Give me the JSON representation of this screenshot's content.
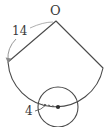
{
  "figure": {
    "type": "geometry-diagram",
    "stroke_color": "#4a4a4a",
    "label_color": "#3a3a3a",
    "background_color": "#ffffff",
    "labels": {
      "apex": "O",
      "slant_radius": "14",
      "base_radius": "4"
    },
    "sector": {
      "name": "cone-lateral-sector",
      "apex": {
        "x": 56,
        "y": 21
      },
      "radius_px": 48,
      "left_vertex": {
        "x": 8,
        "y": 62
      },
      "right_vertex": {
        "x": 103,
        "y": 68
      },
      "arc_lowest_point": {
        "x": 57,
        "y": 88
      },
      "slant_length_value": "14"
    },
    "circle": {
      "name": "cone-base-circle",
      "center": {
        "x": 58,
        "y": 107
      },
      "radius_px": 20,
      "radius_value": "4",
      "center_dot": true,
      "radius_line_style": "dashed",
      "radius_line_direction": "left"
    },
    "leaders": {
      "slant_leader": {
        "from": {
          "x": 14,
          "y": 38
        },
        "to": {
          "x": 8,
          "y": 62
        },
        "arrowhead": true,
        "curved": true
      },
      "slant_leader_upper": {
        "from": {
          "x": 30,
          "y": 29
        },
        "to": {
          "x": 54,
          "y": 22
        },
        "arrowhead": false,
        "curved": true
      },
      "base_leader": {
        "from": {
          "x": 36,
          "y": 110
        },
        "to": {
          "x": 46,
          "y": 104
        },
        "arrowhead": false,
        "curved": false
      }
    }
  }
}
